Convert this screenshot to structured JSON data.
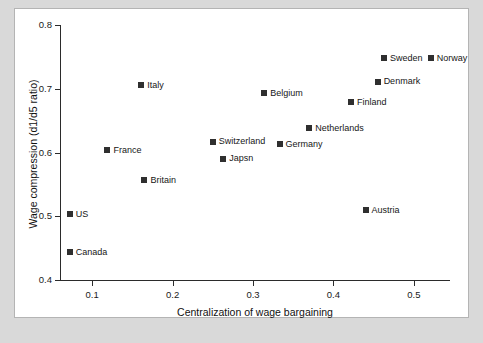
{
  "chart_data": {
    "type": "scatter",
    "title": "",
    "xlabel": "Centralization of wage bargaining",
    "ylabel": "Wage compression (d1/d5 ratio)",
    "xlim": [
      0.06,
      0.545
    ],
    "ylim": [
      0.4,
      0.8
    ],
    "xticks": [
      0.1,
      0.2,
      0.3,
      0.4,
      0.5
    ],
    "xtick_labels": [
      "0.1",
      "0.2",
      "0.3",
      "0.4",
      "0.5"
    ],
    "yticks": [
      0.4,
      0.5,
      0.6,
      0.7,
      0.8
    ],
    "ytick_labels": [
      "0.4",
      "0.5",
      "0.6",
      "0.7",
      "0.8"
    ],
    "grid": false,
    "legend": "none",
    "marker_color": "#2f2f2f",
    "marker_shape": "square",
    "points": [
      {
        "label": "Canada",
        "x": 0.072,
        "y": 0.444
      },
      {
        "label": "US",
        "x": 0.072,
        "y": 0.504
      },
      {
        "label": "France",
        "x": 0.119,
        "y": 0.604
      },
      {
        "label": "Italy",
        "x": 0.161,
        "y": 0.706
      },
      {
        "label": "Britain",
        "x": 0.165,
        "y": 0.557
      },
      {
        "label": "Switzerland",
        "x": 0.25,
        "y": 0.618
      },
      {
        "label": "Japsn",
        "x": 0.263,
        "y": 0.591
      },
      {
        "label": "Belgium",
        "x": 0.314,
        "y": 0.694
      },
      {
        "label": "Germany",
        "x": 0.333,
        "y": 0.614
      },
      {
        "label": "Netherlands",
        "x": 0.37,
        "y": 0.639
      },
      {
        "label": "Finland",
        "x": 0.422,
        "y": 0.68
      },
      {
        "label": "Austria",
        "x": 0.44,
        "y": 0.51
      },
      {
        "label": "Denmark",
        "x": 0.455,
        "y": 0.712
      },
      {
        "label": "Sweden",
        "x": 0.463,
        "y": 0.749
      },
      {
        "label": "Norway",
        "x": 0.521,
        "y": 0.749
      }
    ]
  }
}
